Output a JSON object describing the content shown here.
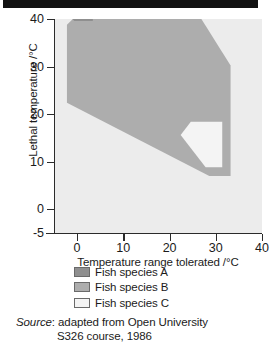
{
  "chart_data": {
    "type": "area",
    "title": "",
    "xlabel": "Temperature range tolerated /°C",
    "ylabel": "Lethal temperature /°C",
    "xlim": [
      -5,
      40
    ],
    "ylim": [
      -5,
      40
    ],
    "xticks": [
      0,
      10,
      20,
      30,
      40
    ],
    "yticks": [
      -5,
      0,
      10,
      20,
      30,
      40
    ],
    "xtick_labels": [
      "0",
      "10",
      "20",
      "30",
      "40"
    ],
    "ytick_labels": [
      "40",
      "30",
      "20",
      "10",
      "0",
      "-5"
    ],
    "grid": false,
    "legend_position": "below-plot",
    "plot_background": "#ececec",
    "series": [
      {
        "name": "Fish species A",
        "color": "#8f8f8f",
        "shape": "polygon",
        "points": [
          [
            -2.2,
            -1.2
          ],
          [
            -0.6,
            0.4
          ],
          [
            3.4,
            0.4
          ],
          [
            3.4,
            -2.0
          ],
          [
            1.2,
            -3.4
          ],
          [
            -2.2,
            -3.4
          ]
        ]
      },
      {
        "name": "Fish species B",
        "color": "#adadad",
        "shape": "polygon",
        "points": [
          [
            -2.2,
            17.6
          ],
          [
            28.6,
            33.0
          ],
          [
            33.2,
            33.0
          ],
          [
            33.2,
            9.8
          ],
          [
            25.6,
            -2.0
          ],
          [
            1.2,
            -2.0
          ],
          [
            -2.2,
            1.2
          ]
        ]
      },
      {
        "name": "Fish species C",
        "color": "#f4f4f4",
        "shape": "polygon",
        "points": [
          [
            22.4,
            24.4
          ],
          [
            27.8,
            31.2
          ],
          [
            31.4,
            31.2
          ],
          [
            31.4,
            21.6
          ],
          [
            24.6,
            21.6
          ]
        ]
      }
    ]
  },
  "legend": {
    "items": [
      {
        "label": "Fish species A",
        "color": "#8f8f8f"
      },
      {
        "label": "Fish species B",
        "color": "#adadad"
      },
      {
        "label": "Fish species C",
        "color": "#f4f4f4"
      }
    ]
  },
  "source": {
    "prefix": "Source",
    "line1": ": adapted from Open University",
    "line2": "S326 course, 1986"
  },
  "axes": {
    "y_title": "Lethal temperature /°C",
    "x_title": "Temperature range tolerated /°C",
    "y_labels": [
      "40",
      "30",
      "20",
      "10",
      "0",
      "-5"
    ],
    "x_labels": [
      "0",
      "10",
      "20",
      "30",
      "40"
    ]
  }
}
